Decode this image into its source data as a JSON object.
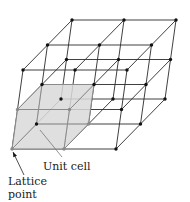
{
  "figure": {
    "labels": {
      "unit_cell": "Unit cell",
      "lattice_point_line1": "Lattice",
      "lattice_point_line2": "point"
    }
  },
  "lattice": {
    "origin": [
      12,
      149
    ],
    "vector_a": [
      52,
      0
    ],
    "vector_b": [
      24.5,
      -25
    ],
    "vector_c": [
      5.5,
      -39.5
    ],
    "counts": [
      3,
      3,
      3
    ],
    "line_color": "#2a2a2a",
    "node_color": "#111111",
    "node_radius": 1.7
  },
  "unit_cell": {
    "fill_color": "#d9d9d9",
    "fill_opacity": 0.85,
    "edge_color": "#8a8a8a",
    "inner_node_color": "#8a8a8a"
  },
  "annotations": {
    "unit_cell_leader": {
      "from": [
        40,
        130
      ],
      "to": [
        62,
        157
      ]
    },
    "lattice_point_arrow": {
      "from": [
        24,
        175
      ],
      "to": [
        13,
        152
      ]
    }
  }
}
